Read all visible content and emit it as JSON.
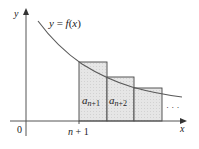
{
  "figure": {
    "curve_label": "y = f(x)",
    "curve_label_parts": {
      "y": "y",
      "eq": " = ",
      "f": "f",
      "paren_open": "(",
      "x": "x",
      "paren_close": ")"
    },
    "axes": {
      "x_label": "x",
      "y_label": "y",
      "origin_label": "0"
    },
    "tick_label": {
      "n": "n",
      "plus_one": " + 1"
    },
    "rectangles": [
      {
        "term": "a",
        "subscript": "n+1",
        "sub_n": "n",
        "sub_op": "+",
        "sub_k": "1"
      },
      {
        "term": "a",
        "subscript": "n+2",
        "sub_n": "n",
        "sub_op": "+",
        "sub_k": "2"
      },
      {
        "term": "",
        "subscript": ""
      }
    ],
    "ellipsis": "· · ·",
    "colors": {
      "axis": "#555555",
      "curve": "#5a5a5a",
      "rect_fill": "#e4e4e4",
      "rect_stroke": "#444444",
      "text": "#222222"
    }
  }
}
